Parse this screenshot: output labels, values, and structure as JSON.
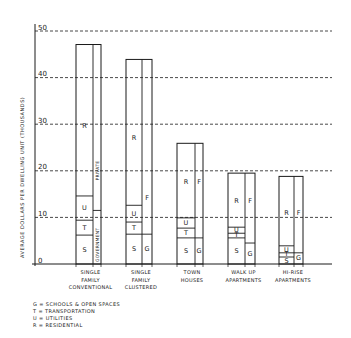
{
  "chart_data": {
    "type": "bar",
    "subtype": "stacked-paired",
    "title": "",
    "xlabel": "",
    "ylabel": "AVERAGE DOLLARS PER DWELLING UNIT (THOUSANDS)",
    "ylim": [
      0,
      50
    ],
    "yticks": [
      0,
      10,
      20,
      30,
      40,
      50
    ],
    "ytick_labels": [
      "0",
      "10",
      "20",
      "30",
      "40",
      "50"
    ],
    "grid": "dashed horizontal",
    "categories": [
      [
        "SINGLE",
        "FAMILY",
        "CONVENTIONAL"
      ],
      [
        "SINGLE",
        "FAMILY",
        "CLUSTERED"
      ],
      [
        "TOWN",
        "HOUSES"
      ],
      [
        "WALK UP",
        "APARTMENTS"
      ],
      [
        "HI-RISE",
        "APARTMENTS"
      ]
    ],
    "series_public_stack": [
      {
        "name": "S",
        "values": [
          6.2,
          6.4,
          5.6,
          5.6,
          1.5
        ]
      },
      {
        "name": "T",
        "values": [
          3.2,
          2.6,
          2.1,
          1.0,
          0.9
        ]
      },
      {
        "name": "U",
        "values": [
          5.2,
          3.6,
          2.2,
          1.3,
          1.5
        ]
      },
      {
        "name": "R",
        "values": [
          32.5,
          31.3,
          16.0,
          11.6,
          14.9
        ]
      }
    ],
    "totals": [
      47.1,
      43.9,
      25.9,
      19.5,
      18.8
    ],
    "series_funding_stack": [
      {
        "name": "G",
        "values": [
          11.5,
          6.4,
          5.6,
          4.5,
          2.4
        ]
      },
      {
        "name": "F",
        "values": [
          35.6,
          37.5,
          20.3,
          15.0,
          16.4
        ]
      }
    ],
    "funding_labels_bar1": {
      "lower": "GOVERNMENT",
      "upper": "PRIVATE"
    },
    "funding_labels_other": {
      "lower": "G",
      "upper": "F"
    },
    "legend": [
      "G = SCHOOLS & OPEN SPACES",
      "T = TRANSPORTATION",
      "U = UTILITIES",
      "R = RESIDENTIAL"
    ],
    "legend_position": "bottom-left"
  }
}
